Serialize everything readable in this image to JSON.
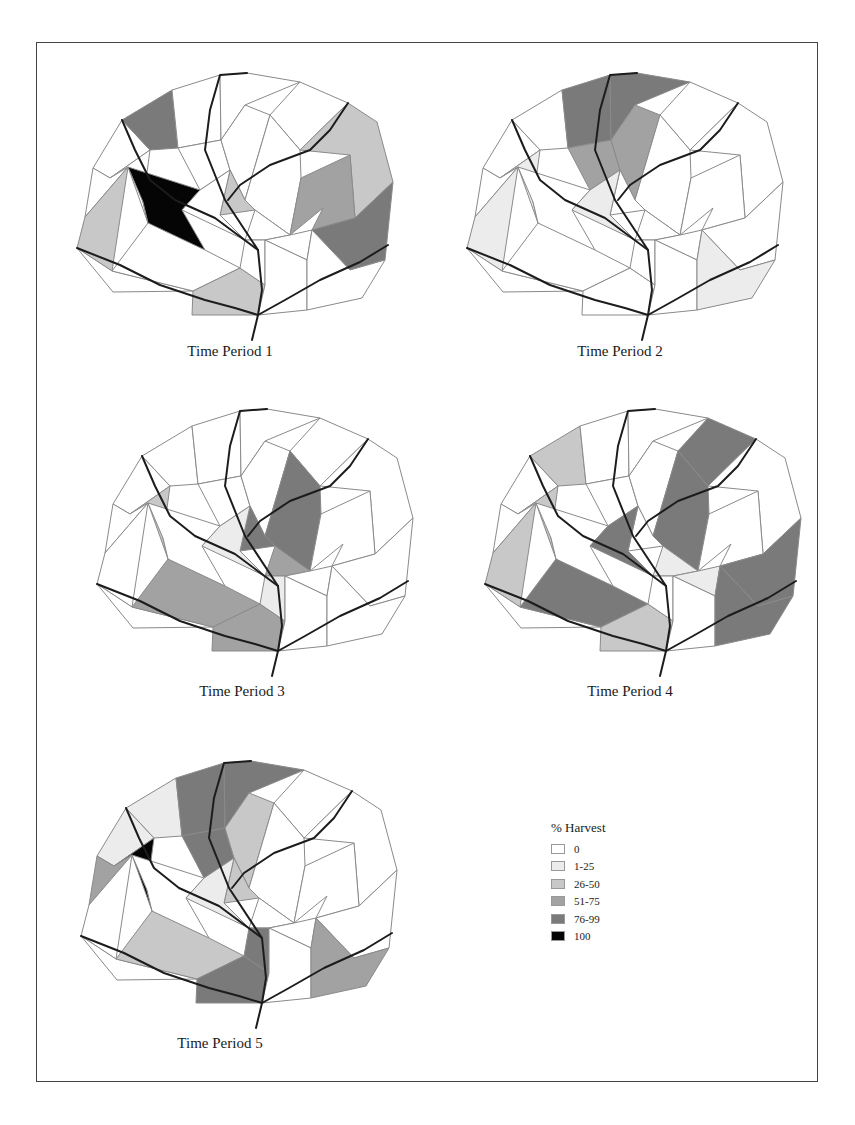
{
  "figure": {
    "panels": [
      {
        "caption": "Time Period 1",
        "cells": {
          "n1": "c76",
          "f1": "c100",
          "w3": "c26",
          "s3": "c26",
          "e1": "c26",
          "c1": "c26",
          "e3": "c51",
          "e4": "c76"
        }
      },
      {
        "caption": "Time Period 2",
        "cells": {
          "n2": "c76",
          "n3": "c76",
          "m2": "c51",
          "m3": "c51",
          "w1": "c1",
          "w3": "c1",
          "c2": "c1",
          "e5": "c1"
        }
      },
      {
        "caption": "Time Period 3",
        "cells": {
          "w1": "c26",
          "c1": "c76",
          "c3": "c76",
          "c4": "c51",
          "s2": "c51",
          "s3": "c51",
          "c2": "c1",
          "s4": "c1"
        }
      },
      {
        "caption": "Time Period 4",
        "cells": {
          "n1": "c26",
          "n4": "c76",
          "w1": "c26",
          "w3": "c26",
          "c3": "c76",
          "s2": "c76",
          "s3": "c26",
          "c4": "c1",
          "c5": "c1",
          "c2": "c76",
          "e4": "c76",
          "e5": "c76"
        }
      },
      {
        "caption": "Time Period 5",
        "cells": {
          "n2": "c76",
          "n3": "c76",
          "m2": "c76",
          "m3": "c26",
          "c1": "c26",
          "w1": "c100",
          "w2": "c51",
          "s2": "c26",
          "c2": "c1",
          "s3": "c76",
          "s4": "c76",
          "e5": "c51",
          "w0": "c1",
          "n1": "c1"
        }
      }
    ]
  },
  "legend": {
    "title": "% Harvest",
    "classes": [
      {
        "id": "c0",
        "label": "0",
        "color": "#ffffff"
      },
      {
        "id": "c1",
        "label": "1-25",
        "color": "#ececec"
      },
      {
        "id": "c26",
        "label": "26-50",
        "color": "#c8c8c8"
      },
      {
        "id": "c51",
        "label": "51-75",
        "color": "#a2a2a2"
      },
      {
        "id": "c76",
        "label": "76-99",
        "color": "#7a7a7a"
      },
      {
        "id": "c100",
        "label": "100",
        "color": "#050505"
      }
    ]
  }
}
